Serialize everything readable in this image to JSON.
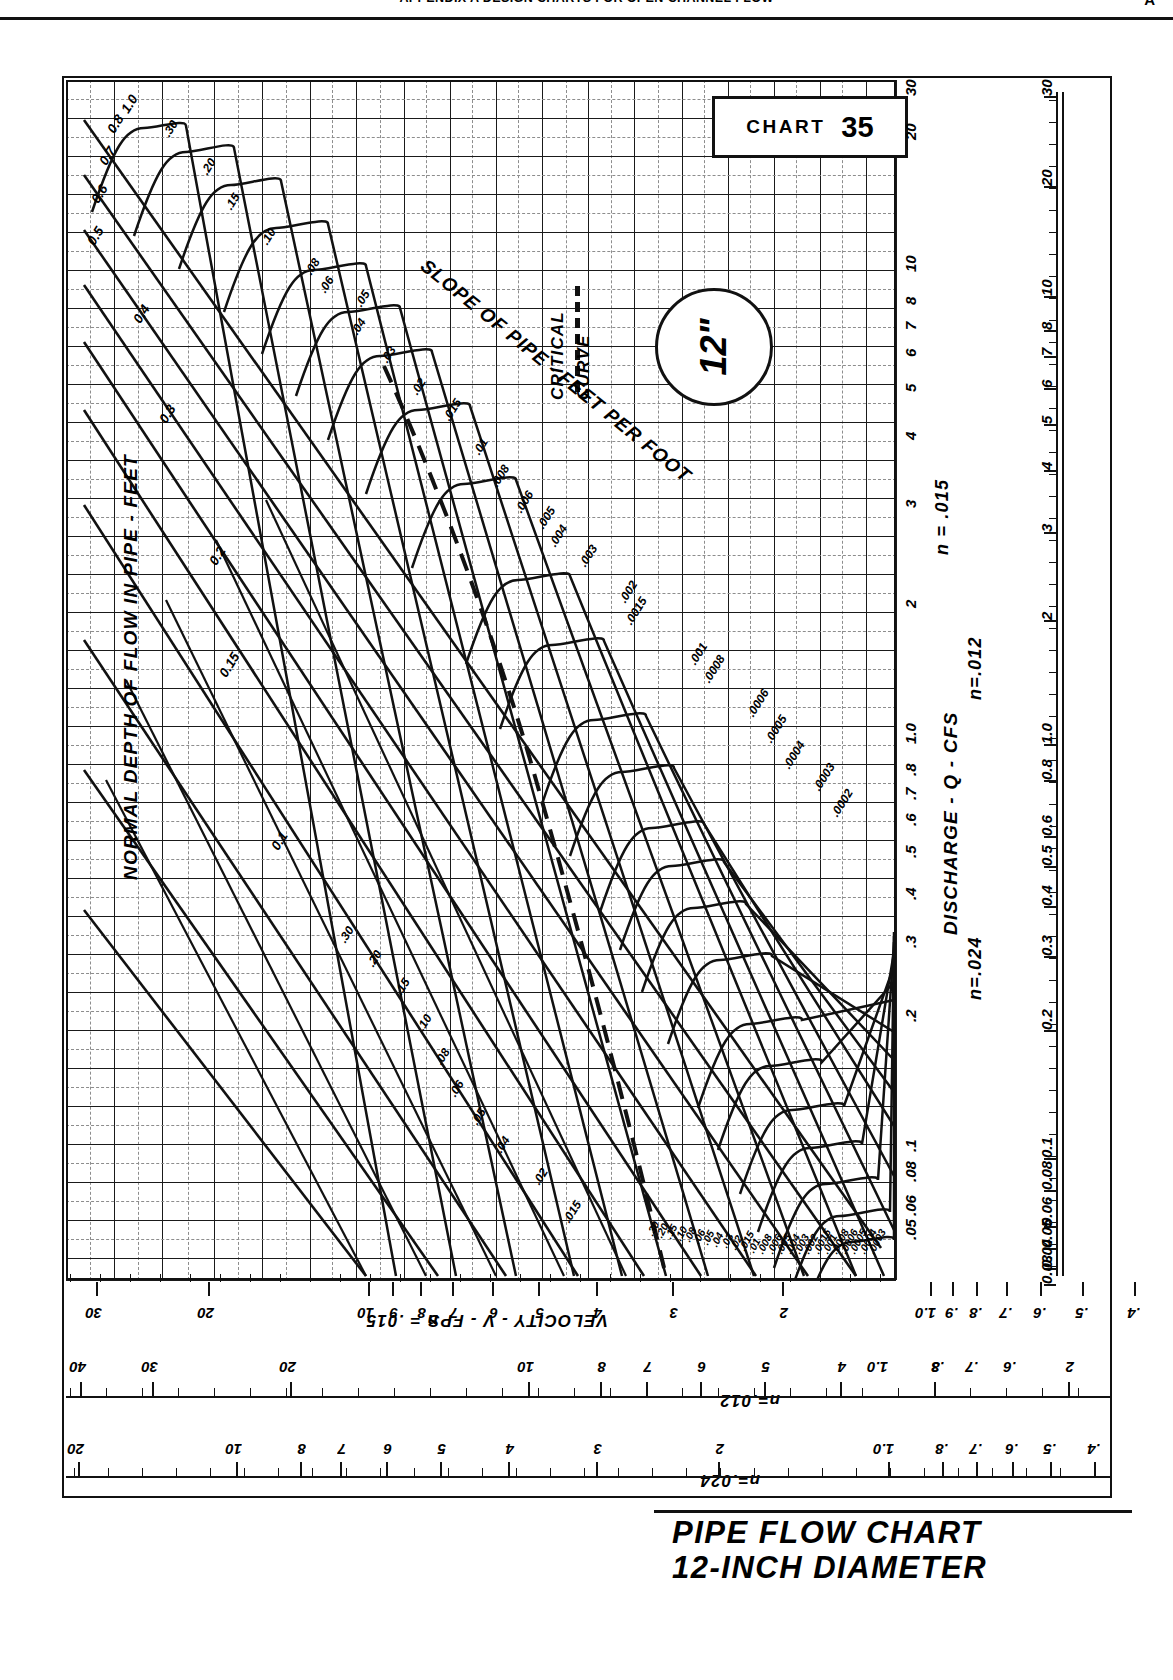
{
  "running_head": {
    "text": "APPENDIX A   DESIGN CHARTS FOR OPEN CHANNEL FLOW",
    "page_number": "A"
  },
  "chart_box": {
    "word": "CHART",
    "number": "35"
  },
  "pipe_badge": {
    "label": "12\""
  },
  "bottom_title": {
    "line1": "PIPE FLOW CHART",
    "line2": "12-INCH DIAMETER"
  },
  "annotations": {
    "critical_curve": "CRITICAL\nCURVE",
    "critical_curve_l1": "CRITICAL",
    "critical_curve_l2": "CURVE",
    "slope_axis": "SLOPE OF PIPE - FEET PER FOOT",
    "depth_axis": "NORMAL DEPTH OF FLOW IN PIPE - FEET",
    "discharge_axis": "DISCHARGE - Q - CFS",
    "velocity_axis": "VELOCITY - V - FPS",
    "n015": "n = .015",
    "n012": "n=.012",
    "n024": "n=.024"
  },
  "chart_data": {
    "type": "line",
    "title": "PIPE FLOW CHART 12-INCH DIAMETER",
    "subtitle": "CHART 35",
    "xlabel": "DISCHARGE - Q - CFS",
    "ylabel": "VELOCITY - V - FPS",
    "grid": true,
    "legend": "none",
    "orientation": "rotated-90-landscape-on-portrait-page",
    "manning_n_scales": [
      "n = .015",
      "n=.012",
      "n=.024"
    ],
    "discharge_ticks_n015": [
      "30",
      "20",
      "10",
      "8",
      "7",
      "6",
      "5",
      "4",
      "3",
      "2",
      "1.0",
      ".8",
      ".7",
      ".6",
      ".5",
      ".4",
      ".3",
      ".2",
      ".1",
      ".08",
      ".06",
      ".05"
    ],
    "discharge_ticks_n012": [
      "20",
      "10",
      "8",
      "7",
      "6",
      "5",
      "4",
      "3",
      "2",
      "1.0",
      "0.8",
      "0.6",
      "0.5",
      "0.4",
      "0.3",
      "0.2",
      "0.1",
      "0.08",
      "0.06",
      "0.05",
      "0.04",
      "0.03"
    ],
    "velocity_ticks_n015": [
      "30",
      "20",
      "10",
      "9",
      "8",
      "7",
      "6",
      "5",
      "4",
      "3",
      "2",
      "1.0",
      ".9",
      ".8",
      ".7",
      ".6",
      ".5",
      ".4"
    ],
    "velocity_ticks_n012": [
      "40",
      "30",
      "20",
      "10",
      "8",
      "7",
      "6",
      "5",
      "4",
      "3",
      "2",
      "1.0",
      ".8",
      ".7",
      ".6"
    ],
    "velocity_ticks_n024": [
      "20",
      "10",
      "8",
      "7",
      "6",
      "5",
      "4",
      "3",
      "2",
      "1.0",
      ".8",
      ".7",
      ".6",
      ".5",
      ".4",
      ".3"
    ],
    "depth_curves": {
      "name": "NORMAL DEPTH OF FLOW IN PIPE - FEET",
      "labels": [
        "1.0",
        "0.8",
        "0.7",
        "0.6",
        "0.5",
        "0.4",
        "0.3",
        "0.2",
        "0.15",
        "0.1"
      ]
    },
    "slope_curves": {
      "name": "SLOPE OF PIPE - FEET PER FOOT",
      "labels_upper": [
        ".30",
        ".20",
        ".15",
        ".10",
        ".08",
        ".06",
        ".05",
        ".04",
        ".03",
        ".02",
        ".015",
        ".01",
        ".008",
        ".006",
        ".005",
        ".004",
        ".003",
        ".002",
        ".0015",
        ".001",
        ".0008",
        ".0006",
        ".0005",
        ".0004",
        ".0003",
        ".0002"
      ],
      "labels_lower": [
        ".30",
        ".20",
        ".15",
        ".10",
        ".08",
        ".06",
        ".05",
        ".04",
        ".03",
        ".02",
        ".015",
        ".01",
        ".008",
        ".006",
        ".005",
        ".004",
        ".003",
        ".002",
        ".0015",
        ".001",
        ".0008",
        ".0006",
        ".0005",
        ".0004",
        ".0003"
      ]
    },
    "critical_curve": {
      "style": "dashed",
      "label": "CRITICAL CURVE"
    }
  },
  "colors": {
    "ink": "#111111",
    "grid": "#1a1a1a",
    "grid_minor": "#9a9a9a",
    "paper": "#ffffff"
  }
}
